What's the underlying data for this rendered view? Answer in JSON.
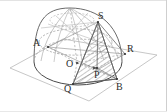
{
  "figure": {
    "kind": "geometry-diagram",
    "background_color": "#ffffff",
    "ink_color": "#4a4a4a",
    "light_ink_color": "#9a9a9a",
    "hatch_color": "#6e6e6e",
    "label_color": "#2b2b2b",
    "labels": [
      {
        "id": "A",
        "text": "A",
        "x": 33,
        "y": 38
      },
      {
        "id": "S",
        "text": "S",
        "x": 98,
        "y": 11
      },
      {
        "id": "R",
        "text": "R",
        "x": 127,
        "y": 44
      },
      {
        "id": "O",
        "text": "O",
        "x": 66,
        "y": 59
      },
      {
        "id": "P",
        "text": "P",
        "x": 94,
        "y": 70
      },
      {
        "id": "Q",
        "text": "Q",
        "x": 64,
        "y": 84
      },
      {
        "id": "B",
        "text": "B",
        "x": 116,
        "y": 82
      }
    ],
    "points": {
      "A": [
        48,
        47
      ],
      "S": [
        98,
        22
      ],
      "R": [
        125,
        54
      ],
      "O": [
        77,
        63
      ],
      "P": [
        97,
        68
      ],
      "Q": [
        73,
        84
      ],
      "B": [
        117,
        79
      ]
    },
    "plane": {
      "name": "ground-plane",
      "corners": [
        [
          10,
          68
        ],
        [
          63,
          39
        ],
        [
          157,
          55
        ],
        [
          89,
          101
        ]
      ]
    },
    "base_ellipse": {
      "cx": 78,
      "cy": 62,
      "rx": 44,
      "ry": 23
    },
    "dome": {
      "apex": [
        70,
        8
      ],
      "half_width": 44
    }
  }
}
